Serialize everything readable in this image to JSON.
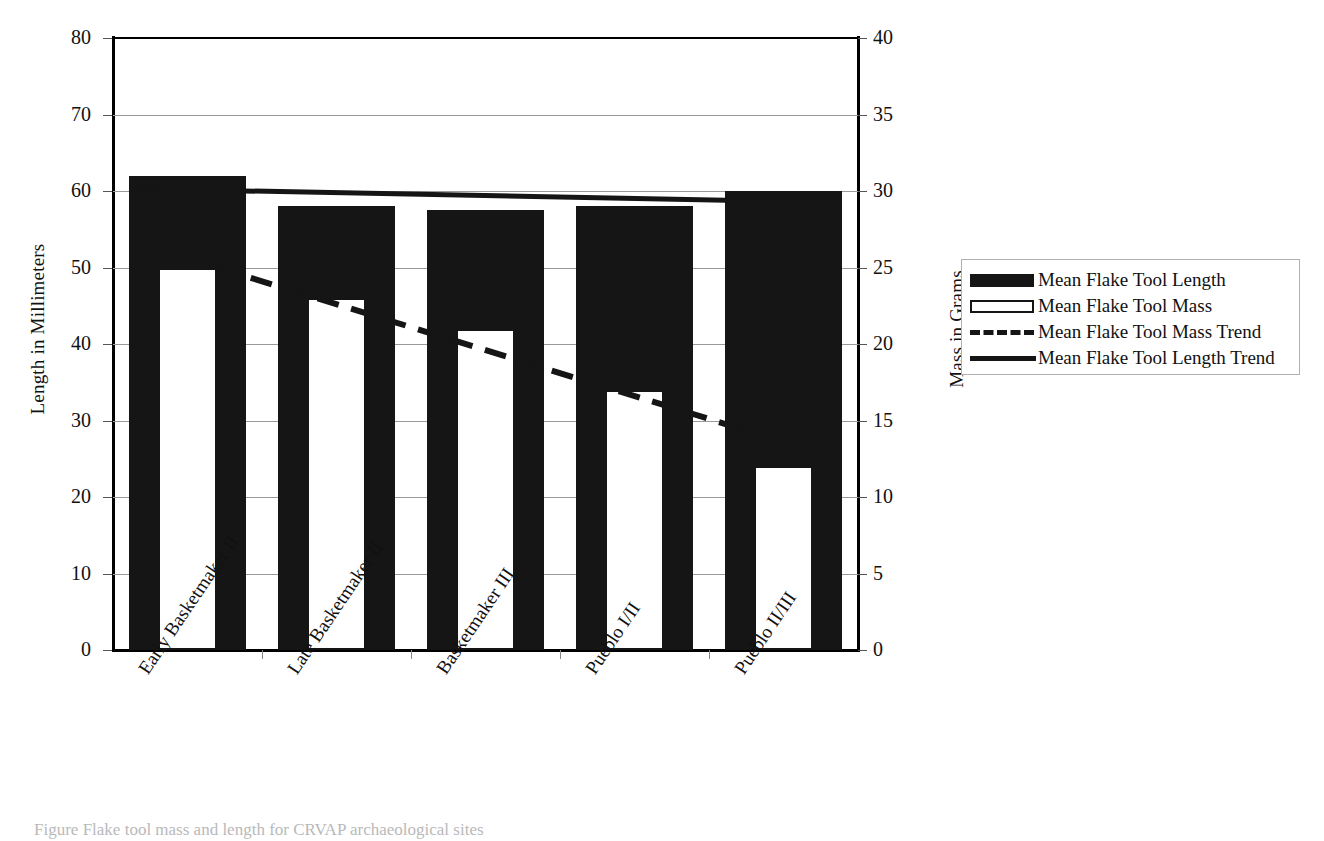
{
  "chart_data": {
    "type": "bar",
    "title": "",
    "categories": [
      "Early Basketmaker II",
      "Late Basketmaker II",
      "Basketmaker III",
      "Pueblo I/II",
      "Pueblo II/III"
    ],
    "series": [
      {
        "name": "Mean Flake Tool Length",
        "axis": "left",
        "unit": "mm",
        "style": "filled-bar",
        "values": [
          62,
          58,
          57.5,
          58,
          60
        ]
      },
      {
        "name": "Mean Flake Tool Mass",
        "axis": "right",
        "unit": "g",
        "style": "open-bar",
        "values": [
          25,
          23,
          21,
          17,
          12
        ]
      },
      {
        "name": "Mean Flake Tool Mass Trend",
        "axis": "right",
        "unit": "g",
        "style": "dashed-line",
        "values": [
          25,
          22.3,
          19.6,
          16.9,
          14.2
        ]
      },
      {
        "name": "Mean Flake Tool Length Trend",
        "axis": "left",
        "unit": "mm",
        "style": "solid-line",
        "values": [
          60.3,
          59.9,
          59.4,
          59.0,
          58.5
        ]
      }
    ],
    "xlabel": "",
    "ylabel": "Length in Millimeters",
    "ylabel_right": "Mass in Grams",
    "ylim": [
      0,
      80
    ],
    "ylim_right": [
      0,
      40
    ],
    "yticks": [
      0,
      10,
      20,
      30,
      40,
      50,
      60,
      70,
      80
    ],
    "yticks_right": [
      0,
      5,
      10,
      15,
      20,
      25,
      30,
      35,
      40
    ],
    "grid": true,
    "legend_position": "right-outside"
  },
  "axes": {
    "left": {
      "title": "Length in Millimeters",
      "ticks": [
        "0",
        "10",
        "20",
        "30",
        "40",
        "50",
        "60",
        "70",
        "80"
      ]
    },
    "right": {
      "title": "Mass in Grams",
      "ticks": [
        "0",
        "5",
        "10",
        "15",
        "20",
        "25",
        "30",
        "35",
        "40"
      ]
    },
    "x": {
      "labels": [
        "Early Basketmaker II",
        "Late Basketmaker II",
        "Basketmaker III",
        "Pueblo I/II",
        "Pueblo II/III"
      ]
    }
  },
  "legend": {
    "items": [
      {
        "label": "Mean Flake Tool Length",
        "key": "filled-swatch"
      },
      {
        "label": "Mean Flake Tool Mass",
        "key": "open-swatch"
      },
      {
        "label": "Mean Flake Tool Mass Trend",
        "key": "dashed-line-swatch"
      },
      {
        "label": "Mean Flake Tool Length Trend",
        "key": "solid-line-swatch"
      }
    ]
  },
  "caption": {
    "text": "Figure       Flake tool mass and length for CRVAP archaeological sites"
  },
  "colors": {
    "bar_fill": "#151515",
    "bar_open_fill": "#ffffff",
    "gridline": "#9a9a9a",
    "axis": "#000000",
    "text": "#111111"
  }
}
